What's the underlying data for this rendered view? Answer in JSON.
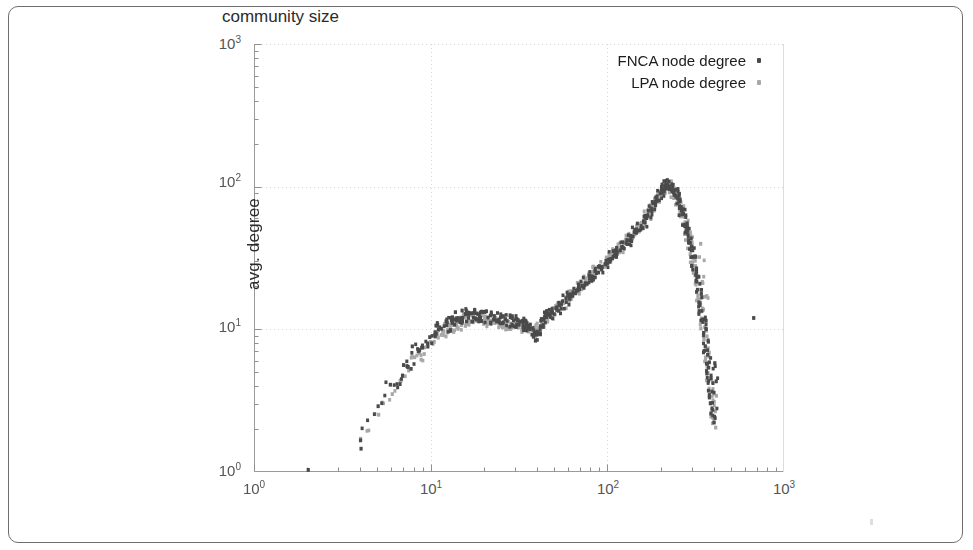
{
  "figure": {
    "frame_border_color": "#6e6e6e",
    "background": "#ffffff"
  },
  "legend": {
    "entries": [
      {
        "label": "FNCA node degree",
        "marker": "square-dot",
        "color": "#4a4a4a"
      },
      {
        "label": "LPA node degree",
        "marker": "square-dot",
        "color": "#a8a8a8"
      }
    ]
  },
  "axes": {
    "x_title": "community size",
    "y_title": "avg. degree",
    "x_ticks": [
      {
        "base": "10",
        "exp": "0"
      },
      {
        "base": "10",
        "exp": "1"
      },
      {
        "base": "10",
        "exp": "2"
      },
      {
        "base": "10",
        "exp": "3"
      }
    ],
    "y_ticks": [
      {
        "base": "10",
        "exp": "3"
      },
      {
        "base": "10",
        "exp": "2"
      },
      {
        "base": "10",
        "exp": "1"
      },
      {
        "base": "10",
        "exp": "0"
      }
    ]
  },
  "chart_data": {
    "type": "scatter",
    "title": "",
    "xlabel": "community size",
    "ylabel": "avg. degree",
    "xscale": "log",
    "yscale": "log",
    "xlim": [
      1,
      1000
    ],
    "ylim": [
      1,
      1000
    ],
    "grid": true,
    "legend_position": "top-right",
    "marker_colors": {
      "FNCA node degree": "#4a4a4a",
      "LPA node degree": "#a8a8a8"
    },
    "series": [
      {
        "name": "FNCA node degree",
        "color": "#4a4a4a",
        "points": [
          [
            2,
            1.0
          ],
          [
            4,
            1.5
          ],
          [
            4,
            1.62
          ],
          [
            5,
            3.0
          ],
          [
            6,
            4.3
          ],
          [
            6.5,
            4.0
          ],
          [
            7,
            5.6
          ],
          [
            7.5,
            5.2
          ],
          [
            8,
            7.4
          ],
          [
            8.6,
            7.0
          ],
          [
            9,
            7.9
          ],
          [
            10,
            8.6
          ],
          [
            10.5,
            9.4
          ],
          [
            11,
            10.4
          ],
          [
            11.5,
            9.8
          ],
          [
            12,
            11.0
          ],
          [
            12.6,
            10.2
          ],
          [
            13,
            11.6
          ],
          [
            13.5,
            10.8
          ],
          [
            14,
            12.6
          ],
          [
            14.5,
            11.4
          ],
          [
            15,
            12.9
          ],
          [
            15.5,
            11.8
          ],
          [
            16,
            13.1
          ],
          [
            16.5,
            12.1
          ],
          [
            17,
            12.7
          ],
          [
            17.5,
            12.0
          ],
          [
            18,
            12.9
          ],
          [
            18.6,
            12.2
          ],
          [
            19,
            12.4
          ],
          [
            19.5,
            11.8
          ],
          [
            20,
            12.6
          ],
          [
            21,
            12.0
          ],
          [
            22,
            12.3
          ],
          [
            23,
            11.8
          ],
          [
            24,
            12.0
          ],
          [
            25,
            11.6
          ],
          [
            26,
            11.9
          ],
          [
            27,
            11.4
          ],
          [
            28,
            11.6
          ],
          [
            29,
            11.2
          ],
          [
            30,
            11.4
          ],
          [
            31,
            11.0
          ],
          [
            32,
            11.2
          ],
          [
            33,
            10.8
          ],
          [
            34,
            10.9
          ],
          [
            35,
            10.6
          ],
          [
            36,
            10.4
          ],
          [
            37,
            10.1
          ],
          [
            38,
            9.7
          ],
          [
            39,
            9.2
          ],
          [
            40,
            8.7
          ],
          [
            41,
            9.9
          ],
          [
            42,
            10.6
          ],
          [
            43,
            11.2
          ],
          [
            44,
            11.8
          ],
          [
            45,
            12.2
          ],
          [
            46,
            12.0
          ],
          [
            47,
            12.6
          ],
          [
            48,
            13.0
          ],
          [
            50,
            13.4
          ],
          [
            52,
            14.0
          ],
          [
            54,
            14.6
          ],
          [
            56,
            15.2
          ],
          [
            58,
            15.9
          ],
          [
            60,
            16.6
          ],
          [
            62,
            17.2
          ],
          [
            65,
            18.0
          ],
          [
            68,
            18.9
          ],
          [
            70,
            19.8
          ],
          [
            73,
            20.6
          ],
          [
            76,
            21.6
          ],
          [
            79,
            22.6
          ],
          [
            82,
            23.6
          ],
          [
            85,
            24.7
          ],
          [
            88,
            25.8
          ],
          [
            92,
            27.0
          ],
          [
            95,
            28.2
          ],
          [
            99,
            29.5
          ],
          [
            103,
            31.0
          ],
          [
            107,
            32.5
          ],
          [
            111,
            34.0
          ],
          [
            115,
            35.6
          ],
          [
            120,
            37.5
          ],
          [
            125,
            39.4
          ],
          [
            130,
            41.5
          ],
          [
            135,
            43.6
          ],
          [
            140,
            46.0
          ],
          [
            145,
            48.4
          ],
          [
            150,
            51.0
          ],
          [
            155,
            53.5
          ],
          [
            160,
            56.5
          ],
          [
            165,
            59.5
          ],
          [
            170,
            63.0
          ],
          [
            175,
            66.5
          ],
          [
            180,
            70.5
          ],
          [
            185,
            74.5
          ],
          [
            190,
            79.0
          ],
          [
            195,
            84.0
          ],
          [
            200,
            89.0
          ],
          [
            205,
            94.0
          ],
          [
            210,
            99.0
          ],
          [
            215,
            103.0
          ],
          [
            220,
            105.0
          ],
          [
            225,
            104.0
          ],
          [
            230,
            101.0
          ],
          [
            235,
            97.0
          ],
          [
            240,
            93.0
          ],
          [
            245,
            88.0
          ],
          [
            250,
            83.0
          ],
          [
            255,
            78.0
          ],
          [
            260,
            73.0
          ],
          [
            265,
            68.0
          ],
          [
            270,
            63.0
          ],
          [
            275,
            58.0
          ],
          [
            280,
            53.0
          ],
          [
            285,
            48.5
          ],
          [
            290,
            44.0
          ],
          [
            295,
            40.0
          ],
          [
            300,
            36.0
          ],
          [
            305,
            32.5
          ],
          [
            310,
            29.0
          ],
          [
            315,
            26.0
          ],
          [
            320,
            23.0
          ],
          [
            325,
            20.5
          ],
          [
            330,
            18.0
          ],
          [
            335,
            16.0
          ],
          [
            340,
            14.0
          ],
          [
            345,
            12.2
          ],
          [
            350,
            10.6
          ],
          [
            355,
            9.2
          ],
          [
            360,
            8.0
          ],
          [
            365,
            7.0
          ],
          [
            370,
            6.0
          ],
          [
            375,
            5.2
          ],
          [
            380,
            4.4
          ],
          [
            385,
            3.8
          ],
          [
            390,
            3.2
          ],
          [
            395,
            2.7
          ],
          [
            400,
            2.2
          ],
          [
            405,
            4.3
          ],
          [
            410,
            5.6
          ],
          [
            690,
            12.0
          ]
        ]
      },
      {
        "name": "LPA node degree",
        "color": "#a8a8a8",
        "points": [
          [
            4,
            1.7
          ],
          [
            5,
            2.6
          ],
          [
            6,
            3.7
          ],
          [
            7,
            4.9
          ],
          [
            8,
            6.4
          ],
          [
            8.6,
            6.2
          ],
          [
            9,
            7.0
          ],
          [
            10,
            8.0
          ],
          [
            10.5,
            8.7
          ],
          [
            11,
            9.6
          ],
          [
            11.5,
            9.1
          ],
          [
            12,
            10.2
          ],
          [
            12.6,
            9.6
          ],
          [
            13,
            10.8
          ],
          [
            13.5,
            10.1
          ],
          [
            14,
            11.6
          ],
          [
            14.5,
            10.7
          ],
          [
            15,
            12.0
          ],
          [
            15.5,
            11.1
          ],
          [
            16,
            12.2
          ],
          [
            16.5,
            11.4
          ],
          [
            17,
            11.9
          ],
          [
            17.5,
            11.3
          ],
          [
            18,
            12.1
          ],
          [
            18.6,
            11.5
          ],
          [
            19,
            11.7
          ],
          [
            19.5,
            11.2
          ],
          [
            20,
            11.9
          ],
          [
            21,
            11.4
          ],
          [
            22,
            11.6
          ],
          [
            23,
            11.2
          ],
          [
            24,
            11.4
          ],
          [
            25,
            11.0
          ],
          [
            26,
            11.2
          ],
          [
            27,
            10.9
          ],
          [
            28,
            11.0
          ],
          [
            29,
            10.7
          ],
          [
            30,
            10.8
          ],
          [
            31,
            10.5
          ],
          [
            32,
            10.6
          ],
          [
            33,
            10.3
          ],
          [
            34,
            10.4
          ],
          [
            35,
            10.1
          ],
          [
            36,
            10.0
          ],
          [
            37,
            9.8
          ],
          [
            38,
            9.5
          ],
          [
            39,
            9.3
          ],
          [
            40,
            9.6
          ],
          [
            41,
            10.2
          ],
          [
            42,
            10.8
          ],
          [
            43,
            11.3
          ],
          [
            44,
            11.7
          ],
          [
            45,
            12.0
          ],
          [
            46,
            12.3
          ],
          [
            47,
            12.7
          ],
          [
            48,
            13.1
          ],
          [
            50,
            13.5
          ],
          [
            52,
            14.1
          ],
          [
            54,
            14.7
          ],
          [
            56,
            15.3
          ],
          [
            58,
            16.0
          ],
          [
            60,
            16.7
          ],
          [
            62,
            17.4
          ],
          [
            65,
            18.2
          ],
          [
            68,
            19.1
          ],
          [
            70,
            20.0
          ],
          [
            73,
            20.9
          ],
          [
            76,
            21.9
          ],
          [
            79,
            22.9
          ],
          [
            82,
            23.9
          ],
          [
            85,
            25.0
          ],
          [
            88,
            26.1
          ],
          [
            92,
            27.3
          ],
          [
            95,
            28.5
          ],
          [
            99,
            29.8
          ],
          [
            103,
            31.3
          ],
          [
            107,
            32.8
          ],
          [
            111,
            34.3
          ],
          [
            115,
            35.9
          ],
          [
            120,
            37.8
          ],
          [
            125,
            39.7
          ],
          [
            130,
            41.8
          ],
          [
            135,
            43.9
          ],
          [
            140,
            46.3
          ],
          [
            145,
            48.7
          ],
          [
            150,
            51.3
          ],
          [
            155,
            53.8
          ],
          [
            160,
            56.8
          ],
          [
            165,
            59.8
          ],
          [
            170,
            63.3
          ],
          [
            175,
            66.8
          ],
          [
            180,
            70.8
          ],
          [
            185,
            74.8
          ],
          [
            190,
            79.3
          ],
          [
            195,
            84.3
          ],
          [
            200,
            88.0
          ],
          [
            205,
            92.0
          ],
          [
            210,
            96.0
          ],
          [
            215,
            99.0
          ],
          [
            220,
            100.0
          ],
          [
            225,
            99.0
          ],
          [
            230,
            96.5
          ],
          [
            235,
            93.0
          ],
          [
            240,
            89.0
          ],
          [
            245,
            85.0
          ],
          [
            250,
            80.0
          ],
          [
            255,
            75.0
          ],
          [
            260,
            70.0
          ],
          [
            265,
            65.5
          ],
          [
            270,
            61.0
          ],
          [
            275,
            56.0
          ],
          [
            280,
            51.5
          ],
          [
            285,
            47.0
          ],
          [
            290,
            43.0
          ],
          [
            295,
            39.0
          ],
          [
            300,
            35.0
          ],
          [
            305,
            31.5
          ],
          [
            310,
            28.0
          ],
          [
            315,
            25.0
          ],
          [
            320,
            22.5
          ],
          [
            325,
            20.0
          ],
          [
            330,
            17.5
          ],
          [
            335,
            15.5
          ],
          [
            340,
            13.5
          ],
          [
            345,
            11.8
          ],
          [
            350,
            10.2
          ],
          [
            355,
            8.9
          ],
          [
            360,
            7.7
          ],
          [
            365,
            6.7
          ],
          [
            370,
            5.8
          ],
          [
            375,
            5.0
          ],
          [
            380,
            4.2
          ],
          [
            385,
            3.6
          ],
          [
            390,
            3.0
          ],
          [
            395,
            2.5
          ],
          [
            400,
            2.1
          ],
          [
            405,
            3.4
          ],
          [
            330,
            38.0
          ],
          [
            350,
            22.0
          ],
          [
            360,
            16.0
          ]
        ]
      }
    ]
  }
}
